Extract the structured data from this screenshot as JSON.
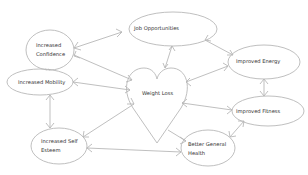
{
  "diagram": {
    "center": {
      "label": "Weight Loss",
      "shape": "heart"
    },
    "nodes": [
      {
        "id": "job",
        "label": "Job Opportunities"
      },
      {
        "id": "confidence",
        "label_lines": [
          "Increased",
          "Confidence"
        ]
      },
      {
        "id": "energy",
        "label": "Improved Energy"
      },
      {
        "id": "mobility",
        "label": "Increased Mobility"
      },
      {
        "id": "fitness",
        "label": "Improved Fitness"
      },
      {
        "id": "esteem",
        "label_lines": [
          "Increased Self",
          "Esteem"
        ]
      },
      {
        "id": "health",
        "label_lines": [
          "Better General",
          "Health"
        ]
      }
    ],
    "colors": {
      "stroke": "#b8b8b8",
      "text": "#333333",
      "background": "#ffffff"
    }
  }
}
